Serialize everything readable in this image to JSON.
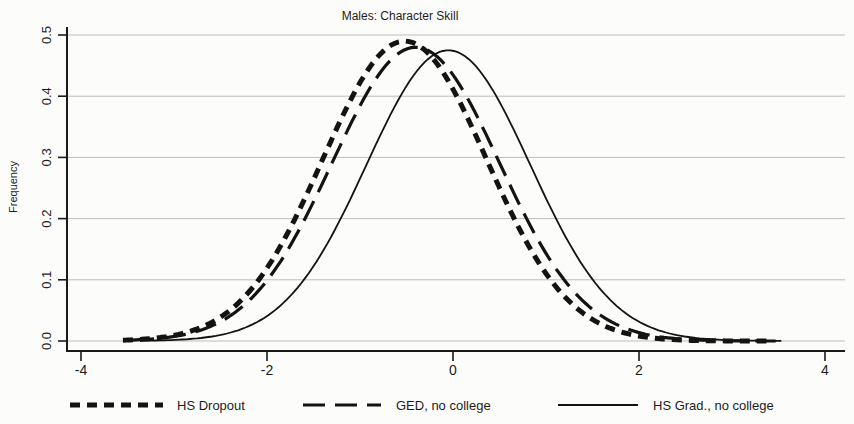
{
  "figure": {
    "background": "#fcfcfa",
    "axis_color": "#1a1a1a",
    "grid_color": "#bdbdbd",
    "curve_color": "#131313",
    "text_color": "#1c1c1c"
  },
  "chart_data": {
    "type": "line",
    "title": "Males: Character Skill",
    "xlabel": "",
    "ylabel": "Frequency",
    "xlim": [
      -4.2,
      4.2
    ],
    "ylim": [
      0,
      0.52
    ],
    "xticks": [
      -4,
      -2,
      0,
      2,
      4
    ],
    "yticks": [
      0,
      0.1,
      0.2,
      0.3,
      0.4,
      0.5
    ],
    "grid": "horizontal gridlines on",
    "legend_position": "bottom",
    "series": [
      {
        "name": "HS Dropout",
        "line_style": "thick-short-dash",
        "shape": "normal-density",
        "mean": -0.52,
        "sd": 0.88,
        "peak": 0.49,
        "x_range": [
          -3.55,
          3.4
        ]
      },
      {
        "name": "GED, no college",
        "line_style": "long-dash",
        "shape": "normal-density",
        "mean": -0.4,
        "sd": 0.9,
        "peak": 0.48,
        "x_range": [
          -3.45,
          3.5
        ]
      },
      {
        "name": "HS Grad., no college",
        "line_style": "solid",
        "shape": "normal-density",
        "mean": -0.05,
        "sd": 0.88,
        "peak": 0.475,
        "x_range": [
          -3.35,
          3.55
        ]
      }
    ],
    "sampled_x": [
      -3.5,
      -3,
      -2.5,
      -2,
      -1.5,
      -1,
      -0.5,
      0,
      0.5,
      1,
      1.5,
      2,
      2.5,
      3,
      3.5
    ],
    "sampled_frequencies": {
      "HS Dropout": [
        0.002,
        0.009,
        0.039,
        0.119,
        0.264,
        0.422,
        0.49,
        0.412,
        0.25,
        0.11,
        0.035,
        0.008,
        0.001,
        0.0,
        0.0
      ],
      "GED, no college": [
        0.001,
        0.007,
        0.032,
        0.099,
        0.227,
        0.384,
        0.477,
        0.435,
        0.291,
        0.143,
        0.052,
        0.014,
        0.003,
        0.0,
        0.0
      ],
      "HS Grad., no college": [
        0.0,
        0.002,
        0.01,
        0.041,
        0.122,
        0.265,
        0.417,
        0.474,
        0.391,
        0.233,
        0.101,
        0.031,
        0.007,
        0.001,
        0.0
      ]
    }
  }
}
